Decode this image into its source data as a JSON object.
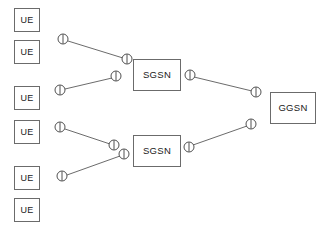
{
  "diagram": {
    "canvas": {
      "width": 329,
      "height": 232,
      "background": "#ffffff"
    },
    "colors": {
      "box_border": "#6b6b6b",
      "box_fill": "#ffffff",
      "line": "#5a5a5a",
      "marker_stroke": "#3d3d3d",
      "marker_fill": "#ffffff",
      "text": "#1a1a1a"
    },
    "nodes": {
      "ue": [
        {
          "id": "ue-1",
          "label": "UE",
          "x": 14,
          "y": 8
        },
        {
          "id": "ue-2",
          "label": "UE",
          "x": 14,
          "y": 40
        },
        {
          "id": "ue-3",
          "label": "UE",
          "x": 14,
          "y": 86
        },
        {
          "id": "ue-4",
          "label": "UE",
          "x": 14,
          "y": 120
        },
        {
          "id": "ue-5",
          "label": "UE",
          "x": 14,
          "y": 166
        },
        {
          "id": "ue-6",
          "label": "UE",
          "x": 14,
          "y": 198
        }
      ],
      "sgsn": [
        {
          "id": "sgsn-1",
          "label": "SGSN",
          "x": 133,
          "y": 59
        },
        {
          "id": "sgsn-2",
          "label": "SGSN",
          "x": 133,
          "y": 135
        }
      ],
      "ggsn": [
        {
          "id": "ggsn-1",
          "label": "GGSN",
          "x": 270,
          "y": 92
        }
      ]
    },
    "markers": [
      {
        "id": "marker-ue2-access",
        "cx": 63,
        "cy": 39,
        "r": 5
      },
      {
        "id": "marker-sgsn1-in-upper",
        "cx": 127,
        "cy": 59,
        "r": 5
      },
      {
        "id": "marker-sgsn1-in-lower",
        "cx": 116,
        "cy": 76,
        "r": 5
      },
      {
        "id": "marker-ue3-access",
        "cx": 60,
        "cy": 90,
        "r": 5
      },
      {
        "id": "marker-sgsn1-out",
        "cx": 190,
        "cy": 75,
        "r": 5
      },
      {
        "id": "marker-ggsn-in-upper",
        "cx": 256,
        "cy": 92,
        "r": 5
      },
      {
        "id": "marker-ue4-access",
        "cx": 60,
        "cy": 127,
        "r": 5
      },
      {
        "id": "marker-sgsn2-in-upper",
        "cx": 114,
        "cy": 145,
        "r": 5
      },
      {
        "id": "marker-sgsn2-in-lower",
        "cx": 124,
        "cy": 154,
        "r": 5
      },
      {
        "id": "marker-ue5-access",
        "cx": 62,
        "cy": 176,
        "r": 5
      },
      {
        "id": "marker-sgsn2-out",
        "cx": 189,
        "cy": 147,
        "r": 5
      },
      {
        "id": "marker-ggsn-in-lower",
        "cx": 251,
        "cy": 124,
        "r": 5
      }
    ],
    "links": [
      {
        "id": "link-ue2-sgsn1",
        "x1": 68,
        "y1": 41,
        "x2": 123,
        "y2": 58
      },
      {
        "id": "link-ue3-sgsn1",
        "x1": 65,
        "y1": 89,
        "x2": 112,
        "y2": 78
      },
      {
        "id": "link-sgsn1-ggsn",
        "x1": 194,
        "y1": 77,
        "x2": 252,
        "y2": 91
      },
      {
        "id": "link-ue4-sgsn2",
        "x1": 65,
        "y1": 129,
        "x2": 110,
        "y2": 144
      },
      {
        "id": "link-ue5-sgsn2",
        "x1": 67,
        "y1": 175,
        "x2": 120,
        "y2": 156
      },
      {
        "id": "link-sgsn2-ggsn",
        "x1": 193,
        "y1": 145,
        "x2": 247,
        "y2": 126
      }
    ]
  }
}
